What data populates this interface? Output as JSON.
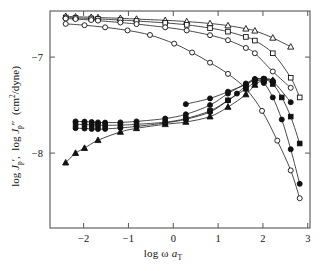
{
  "figure": {
    "background": "#ffffff",
    "frame_color": "#555555",
    "curve_color": "#2b2b2b",
    "marker_open_fill": "#ffffff",
    "marker_filled_fill": "#111111"
  },
  "axes": {
    "x": {
      "label_html": "log &#969; <span class=\"ital\">a</span><span class=\"sub\">T</span>",
      "label_text": "log ω a_T",
      "ticks": [
        -2,
        -1,
        0,
        1,
        2,
        3
      ],
      "tick_labels": [
        "−2",
        "−1",
        "0",
        "1",
        "2",
        "3"
      ],
      "min": -2.75,
      "max": 3.05
    },
    "y": {
      "label_html": "log <span class=\"ital\">J</span><span class=\"sub\">p</span>&#8242;, &nbsp;log <span class=\"ital\">J</span><span class=\"sub\">p</span>&#8243; &nbsp;(cm<span class=\"sup\">2</span>/dyne)",
      "label_text": "log J'_p, log J''_p (cm2/dyne)",
      "ticks": [
        -7,
        -8
      ],
      "tick_labels": [
        "−7",
        "−8"
      ],
      "min": -8.78,
      "max": -6.52
    }
  },
  "chart_data": {
    "type": "scatter",
    "title": "",
    "subtitle": "",
    "xlabel": "log ω a_T",
    "ylabel": "log J'_p, log J''_p (cm2/dyne)",
    "xlim": [
      -2.75,
      3.05
    ],
    "ylim": [
      -8.78,
      -6.52
    ],
    "xticks": [
      -2,
      -1,
      0,
      1,
      2,
      3
    ],
    "yticks": [
      -7,
      -8
    ],
    "grid": false,
    "legend": "none",
    "lines_connect_points": true,
    "series": [
      {
        "name": "J'_p sample 1",
        "marker": "triangle-open",
        "filled": false,
        "quantity": "storage compliance",
        "points": [
          [
            -2.4,
            -6.575
          ],
          [
            -2.18,
            -6.58
          ],
          [
            -1.83,
            -6.585
          ],
          [
            -1.68,
            -6.588
          ],
          [
            -1.18,
            -6.596
          ],
          [
            -0.82,
            -6.604
          ],
          [
            -0.18,
            -6.617
          ],
          [
            0.3,
            -6.63
          ],
          [
            0.82,
            -6.65
          ],
          [
            1.22,
            -6.672
          ],
          [
            1.62,
            -6.705
          ],
          [
            1.82,
            -6.726
          ],
          [
            2.22,
            -6.8
          ],
          [
            2.62,
            -6.893
          ]
        ]
      },
      {
        "name": "J'_p sample 2",
        "marker": "square-open",
        "filled": false,
        "quantity": "storage compliance",
        "points": [
          [
            -2.4,
            -6.588
          ],
          [
            -2.18,
            -6.592
          ],
          [
            -1.83,
            -6.598
          ],
          [
            -1.68,
            -6.602
          ],
          [
            -1.18,
            -6.614
          ],
          [
            -0.82,
            -6.624
          ],
          [
            -0.18,
            -6.644
          ],
          [
            0.3,
            -6.664
          ],
          [
            0.82,
            -6.698
          ],
          [
            1.22,
            -6.735
          ],
          [
            1.62,
            -6.79
          ],
          [
            1.82,
            -6.828
          ],
          [
            2.22,
            -6.96
          ],
          [
            2.62,
            -7.215
          ],
          [
            2.82,
            -7.42
          ]
        ]
      },
      {
        "name": "J'_p sample 3",
        "marker": "circle-open",
        "filled": false,
        "quantity": "storage compliance",
        "points": [
          [
            -2.4,
            -6.598
          ],
          [
            -2.18,
            -6.604
          ],
          [
            -1.83,
            -6.614
          ],
          [
            -1.68,
            -6.62
          ],
          [
            -1.18,
            -6.64
          ],
          [
            -0.82,
            -6.656
          ],
          [
            -0.18,
            -6.69
          ],
          [
            0.3,
            -6.722
          ],
          [
            0.82,
            -6.772
          ],
          [
            1.22,
            -6.824
          ],
          [
            1.62,
            -6.905
          ],
          [
            1.82,
            -6.96
          ],
          [
            2.22,
            -7.15
          ],
          [
            2.62,
            -7.32
          ]
        ]
      },
      {
        "name": "J'_p sample 4",
        "marker": "circle-open",
        "filled": false,
        "quantity": "storage compliance",
        "points": [
          [
            -2.4,
            -6.654
          ],
          [
            -1.98,
            -6.668
          ],
          [
            -1.52,
            -6.69
          ],
          [
            -1.02,
            -6.722
          ],
          [
            -0.52,
            -6.77
          ],
          [
            0.02,
            -6.86
          ],
          [
            0.42,
            -6.952
          ],
          [
            0.82,
            -7.058
          ],
          [
            1.22,
            -7.175
          ],
          [
            1.62,
            -7.33
          ],
          [
            1.98,
            -7.56
          ],
          [
            2.32,
            -7.87
          ],
          [
            2.62,
            -8.18
          ],
          [
            2.82,
            -8.47
          ]
        ]
      },
      {
        "name": "J''_p sample 1",
        "marker": "circle-filled",
        "filled": true,
        "quantity": "loss compliance",
        "points": [
          [
            -2.18,
            -7.67
          ],
          [
            -1.98,
            -7.672
          ],
          [
            -1.82,
            -7.676
          ],
          [
            -1.68,
            -7.68
          ],
          [
            -1.52,
            -7.682
          ],
          [
            -1.18,
            -7.68
          ],
          [
            -0.82,
            -7.67
          ],
          [
            -0.18,
            -7.64
          ],
          [
            0.28,
            -7.596
          ],
          [
            0.82,
            -7.5
          ],
          [
            1.22,
            -7.38
          ],
          [
            1.62,
            -7.275
          ],
          [
            1.82,
            -7.228
          ],
          [
            2.02,
            -7.225
          ],
          [
            2.22,
            -7.25
          ],
          [
            2.62,
            -7.47
          ]
        ]
      },
      {
        "name": "J''_p sample 2",
        "marker": "square-filled",
        "filled": true,
        "quantity": "loss compliance",
        "points": [
          [
            -2.18,
            -7.7
          ],
          [
            -1.98,
            -7.702
          ],
          [
            -1.82,
            -7.706
          ],
          [
            -1.68,
            -7.708
          ],
          [
            -1.52,
            -7.71
          ],
          [
            -1.18,
            -7.708
          ],
          [
            -0.82,
            -7.7
          ],
          [
            -0.18,
            -7.678
          ],
          [
            0.28,
            -7.64
          ],
          [
            0.82,
            -7.56
          ],
          [
            1.22,
            -7.45
          ],
          [
            1.62,
            -7.33
          ],
          [
            1.82,
            -7.26
          ],
          [
            2.02,
            -7.232
          ],
          [
            2.22,
            -7.28
          ],
          [
            2.42,
            -7.42
          ],
          [
            2.62,
            -7.62
          ],
          [
            2.82,
            -7.9
          ]
        ]
      },
      {
        "name": "J''_p sample 3",
        "marker": "circle-filled",
        "filled": true,
        "quantity": "loss compliance",
        "points": [
          [
            -2.18,
            -7.74
          ],
          [
            -1.98,
            -7.744
          ],
          [
            -1.82,
            -7.748
          ],
          [
            -1.68,
            -7.75
          ],
          [
            -1.52,
            -7.748
          ],
          [
            -1.18,
            -7.738
          ],
          [
            -0.82,
            -7.722
          ],
          [
            -0.18,
            -7.686
          ],
          [
            0.28,
            -7.648
          ],
          [
            0.82,
            -7.572
          ],
          [
            1.22,
            -7.452
          ],
          [
            1.42,
            -7.38
          ],
          [
            1.62,
            -7.3
          ],
          [
            1.82,
            -7.236
          ],
          [
            2.02,
            -7.27
          ],
          [
            2.22,
            -7.42
          ],
          [
            2.42,
            -7.65
          ],
          [
            2.62,
            -7.96
          ],
          [
            2.82,
            -8.32
          ]
        ]
      },
      {
        "name": "J''_p sample 4",
        "marker": "triangle-filled",
        "filled": true,
        "quantity": "loss compliance",
        "points": [
          [
            -2.4,
            -8.1
          ],
          [
            -2.18,
            -8.0
          ],
          [
            -1.98,
            -7.948
          ],
          [
            -1.68,
            -7.866
          ],
          [
            -1.18,
            -7.78
          ],
          [
            -0.82,
            -7.742
          ],
          [
            -0.18,
            -7.7
          ],
          [
            0.28,
            -7.676
          ],
          [
            0.82,
            -7.62
          ],
          [
            1.22,
            -7.52
          ],
          [
            1.62,
            -7.39
          ],
          [
            1.82,
            -7.29
          ],
          [
            2.02,
            -7.238
          ],
          [
            2.22,
            -7.24
          ]
        ]
      },
      {
        "name": "J''_p sample 5 (upper branch)",
        "marker": "circle-filled",
        "filled": true,
        "quantity": "loss compliance",
        "points": [
          [
            0.28,
            -7.49
          ],
          [
            0.82,
            -7.43
          ],
          [
            1.22,
            -7.36
          ],
          [
            1.62,
            -7.285
          ],
          [
            1.82,
            -7.232
          ],
          [
            2.02,
            -7.226
          ],
          [
            2.22,
            -7.25
          ]
        ]
      }
    ]
  }
}
